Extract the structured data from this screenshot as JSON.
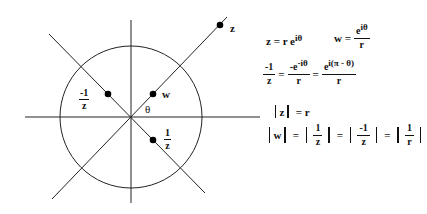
{
  "diagram": {
    "center": [
      131,
      117
    ],
    "radius": 71,
    "stroke_color": "#222222",
    "axes": {
      "horizontal": {
        "x1": 25,
        "y1": 117,
        "x2": 260,
        "y2": 117
      },
      "vertical": {
        "x1": 131,
        "y1": 20,
        "x2": 131,
        "y2": 203
      }
    },
    "rays": [
      {
        "name": "ray-theta",
        "x1": 52,
        "y1": 199,
        "x2": 227,
        "y2": 17
      },
      {
        "name": "ray-minus-theta",
        "x1": 49,
        "y1": 34,
        "x2": 205,
        "y2": 193
      }
    ],
    "points": [
      {
        "name": "z",
        "x": 220,
        "y": 25
      },
      {
        "name": "w",
        "x": 153,
        "y": 94
      },
      {
        "name": "neg-inv-z",
        "x": 108,
        "y": 94
      },
      {
        "name": "inv-z",
        "x": 153,
        "y": 140
      }
    ],
    "labels": {
      "z": "z",
      "w": "w",
      "theta": "θ",
      "neg_inv_z": {
        "num": "-1",
        "den": "z"
      },
      "inv_z": {
        "num": "1",
        "den": "z"
      }
    }
  },
  "equations": {
    "eq1": {
      "lhs": "z = r e",
      "exp": "iθ"
    },
    "eq2": {
      "lhs": "w =",
      "num": "e",
      "num_exp": "iθ",
      "den": "r"
    },
    "eq3": {
      "lhs": {
        "num": "-1",
        "den": "z"
      },
      "eq": "=",
      "mid": {
        "num": "-e",
        "num_exp": "-iθ",
        "den": "r"
      },
      "eq2": "=",
      "rhs": {
        "num": "e",
        "num_exp": "i(π - θ)",
        "den": "r"
      }
    },
    "eq4": {
      "lhs": "z",
      "rhs": "= r"
    },
    "eq5": {
      "a": "w",
      "eq": "=",
      "b": {
        "num": "1",
        "den": "z"
      },
      "c": {
        "num": "-1",
        "den": "z"
      },
      "d": {
        "num": "1",
        "den": "r"
      }
    }
  }
}
